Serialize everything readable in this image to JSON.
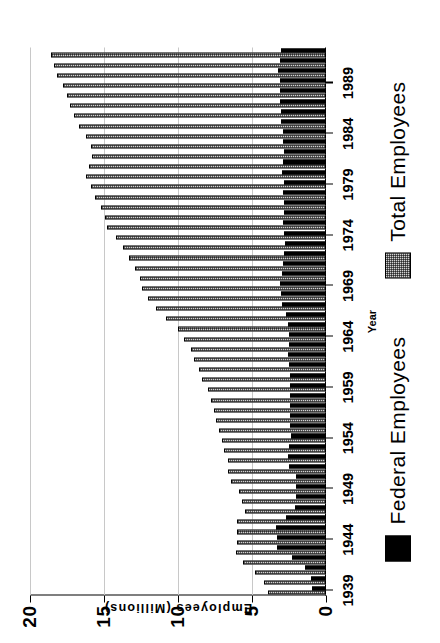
{
  "chart_data": {
    "type": "bar",
    "orientation": "horizontal",
    "title": "",
    "xlabel": "Year",
    "ylabel": "Employees (Millions)",
    "ylim": [
      0,
      20
    ],
    "yticks": [
      0,
      5,
      10,
      15,
      20
    ],
    "ytick_labels": [
      "0",
      "5",
      "10",
      "15",
      "20"
    ],
    "xtick_labels": [
      "1939",
      "1944",
      "1949",
      "1954",
      "1959",
      "1964",
      "1969",
      "1974",
      "1979",
      "1984",
      "1989"
    ],
    "grid": true,
    "legend_position": "bottom",
    "legend": [
      {
        "name": "Federal Employees",
        "swatch": "solid-black"
      },
      {
        "name": "Total Employees",
        "swatch": "hatched-gray"
      }
    ],
    "categories": [
      1939,
      1940,
      1941,
      1942,
      1943,
      1944,
      1945,
      1946,
      1947,
      1948,
      1949,
      1950,
      1951,
      1952,
      1953,
      1954,
      1955,
      1956,
      1957,
      1958,
      1959,
      1960,
      1961,
      1962,
      1963,
      1964,
      1965,
      1966,
      1967,
      1968,
      1969,
      1970,
      1971,
      1972,
      1973,
      1974,
      1975,
      1976,
      1977,
      1978,
      1979,
      1980,
      1981,
      1982,
      1983,
      1984,
      1985,
      1986,
      1987,
      1988,
      1989,
      1990,
      1991,
      1992
    ],
    "series": [
      {
        "name": "Total Employees",
        "swatch": "hatched-gray",
        "values": [
          3.9,
          4.2,
          4.8,
          5.6,
          6.1,
          6.0,
          6.0,
          6.0,
          5.5,
          5.7,
          5.9,
          6.4,
          6.6,
          6.6,
          6.9,
          7.0,
          7.2,
          7.4,
          7.6,
          7.8,
          8.0,
          8.4,
          8.6,
          8.9,
          9.1,
          9.6,
          10.0,
          10.8,
          11.5,
          12.0,
          12.4,
          12.6,
          12.9,
          13.3,
          13.7,
          14.2,
          14.8,
          14.9,
          15.2,
          15.6,
          15.9,
          16.2,
          16.0,
          15.8,
          15.9,
          16.2,
          16.7,
          17.0,
          17.3,
          17.5,
          17.8,
          18.2,
          18.4,
          18.6
        ]
      },
      {
        "name": "Federal Employees",
        "swatch": "solid-black",
        "values": [
          0.95,
          1.04,
          1.44,
          2.3,
          3.3,
          3.3,
          3.4,
          2.7,
          2.1,
          2.05,
          2.05,
          2.0,
          2.48,
          2.57,
          2.53,
          2.38,
          2.4,
          2.4,
          2.43,
          2.4,
          2.4,
          2.42,
          2.48,
          2.54,
          2.53,
          2.51,
          2.56,
          2.73,
          2.96,
          3.02,
          3.08,
          3.0,
          2.88,
          2.82,
          2.78,
          2.85,
          2.89,
          2.84,
          2.85,
          2.88,
          2.87,
          2.99,
          2.92,
          2.85,
          2.88,
          2.94,
          3.02,
          3.02,
          3.09,
          3.11,
          3.12,
          3.23,
          3.1,
          3.05
        ]
      }
    ]
  }
}
